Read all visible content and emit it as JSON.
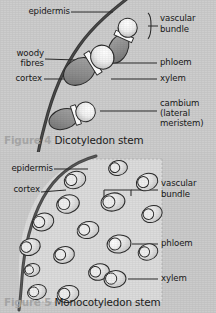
{
  "page": {
    "background_color": "#cdcdcd",
    "text_color": "#181818"
  },
  "figures": [
    {
      "id": "figure-4",
      "number": "Figure 4",
      "title": "Dicotyledon stem",
      "caption_number_color": "#a9a9a9",
      "caption_text_color": "#1b1b1b",
      "labels": {
        "epidermis": "epidermis",
        "vascular_bundle_line1": "vascular",
        "vascular_bundle_line2": "bundle",
        "woody_fibres_line1": "woody",
        "woody_fibres_line2": "fibres",
        "cortex": "cortex",
        "phloem": "phloem",
        "xylem": "xylem",
        "cambium_line1": "cambium",
        "cambium_line2": "(lateral",
        "cambium_line3": "meristem)"
      },
      "colors": {
        "epidermis_line": "#3a3a3a",
        "phloem_fill": "#f2f2f2",
        "xylem_fill": "#8e8e8e",
        "cambium_band": "#ffffff",
        "outline": "#2b2b2b",
        "leader_line": "#2b2b2b"
      },
      "vascular_bundles": 3
    },
    {
      "id": "figure-5",
      "number": "Figure 5",
      "title": "Monocotyledon stem",
      "caption_number_color": "#a9a9a9",
      "caption_text_color": "#1b1b1b",
      "labels": {
        "epidermis": "epidermis",
        "cortex": "cortex",
        "vascular_bundle_line1": "vascular",
        "vascular_bundle_line2": "bundle",
        "phloem": "phloem",
        "xylem": "xylem"
      },
      "colors": {
        "epidermis_line": "#4a4a4a",
        "interior_fill": "#dcdcdc",
        "bundle_fill": "#d2d2d2",
        "phloem_fill": "#f4f4f4",
        "outline": "#2b2b2b",
        "panel_border": "#b4b4b4"
      },
      "vascular_bundles": 17
    }
  ]
}
